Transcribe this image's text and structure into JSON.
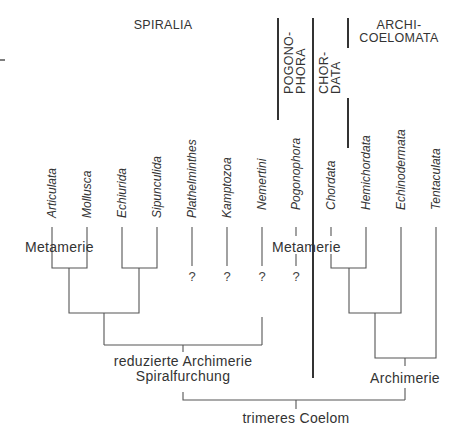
{
  "figure": {
    "type": "cladogram",
    "background": "#ffffff",
    "line_color": "#555555"
  },
  "groups": {
    "spiralia": "SPIRALIA",
    "pogonophora_line1": "POGONO-",
    "pogonophora_line2": "PHORA",
    "chordata_line1": "CHOR-",
    "chordata_line2": "DATA",
    "archicoelomata_line1": "ARCHI-",
    "archicoelomata_line2": "COELOMATA"
  },
  "taxa": [
    {
      "name": "Articulata",
      "x": 52
    },
    {
      "name": "Mollusca",
      "x": 87
    },
    {
      "name": "Echiurida",
      "x": 122
    },
    {
      "name": "Sipunculida",
      "x": 157
    },
    {
      "name": "Plathelminthes",
      "x": 192
    },
    {
      "name": "Kamptozoa",
      "x": 227
    },
    {
      "name": "Nemertini",
      "x": 262
    },
    {
      "name": "Pogonophora",
      "x": 296
    },
    {
      "name": "Chordata",
      "x": 331
    },
    {
      "name": "Hemichordata",
      "x": 366
    },
    {
      "name": "Echinodermata",
      "x": 401
    },
    {
      "name": "Tentaculata",
      "x": 436
    }
  ],
  "characters": {
    "metamerie_left": "Metamerie",
    "metamerie_right": "Metamerie",
    "reduzierte_archimerie": "reduzierte Archimerie",
    "spiralfurchung": "Spiralfurchung",
    "archimerie": "Archimerie",
    "trimeres_coelom": "trimeres Coelom"
  },
  "uncertain": {
    "plathelminthes": "?",
    "kamptozoa": "?",
    "nemertini": "?",
    "pogonophora": "?"
  }
}
